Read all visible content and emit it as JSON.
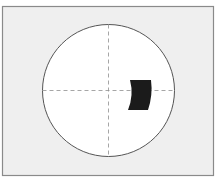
{
  "diagram": {
    "type": "viewfinder-target",
    "frame": {
      "x": 2.5,
      "y": 6.5,
      "width": 211,
      "height": 169,
      "fill": "#efefef",
      "stroke": "#8a8a8a"
    },
    "circle": {
      "cx": 108.5,
      "cy": 90.5,
      "r": 66,
      "fill": "#ffffff",
      "stroke": "#555555"
    },
    "crosshair": {
      "color": "#8f8f8f",
      "dash": "4 3"
    },
    "marker": {
      "fill": "#1b1b1b",
      "shape": "annular-sector",
      "position": "right-of-center"
    }
  }
}
